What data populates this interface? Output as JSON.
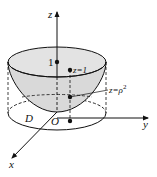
{
  "diagram": {
    "axes": {
      "x_label": "x",
      "y_label": "y",
      "z_label": "z",
      "origin_label": "O"
    },
    "labels": {
      "height_one": "1",
      "plane": "z=1",
      "surface_z": "z=",
      "surface_rho": "ρ",
      "surface_exp": "2",
      "region": "D"
    },
    "colors": {
      "surface_fill": "#d9d9d9",
      "line": "#111111",
      "background": "#ffffff"
    }
  }
}
